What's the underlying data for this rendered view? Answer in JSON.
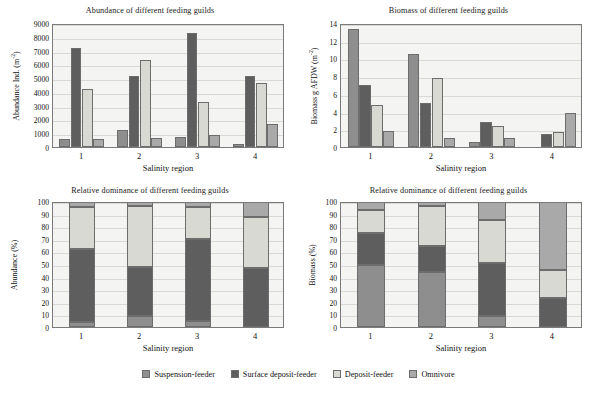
{
  "colors": {
    "suspension_feeder": "#8e8e8e",
    "surface_deposit_feeder": "#5e5e5e",
    "deposit_feeder": "#d9d9d4",
    "omnivore": "#a9a9a9",
    "plot_background": "#f4f4f2",
    "axis": "#7a7a7a",
    "gridline": "#d8d8d4"
  },
  "legend": {
    "items": [
      {
        "label": "Suspension-feeder",
        "color_key": "suspension_feeder"
      },
      {
        "label": "Surface deposit-feeder",
        "color_key": "surface_deposit_feeder"
      },
      {
        "label": "Deposit-feeder",
        "color_key": "deposit_feeder"
      },
      {
        "label": "Omnivore",
        "color_key": "omnivore"
      }
    ]
  },
  "chart_data": [
    {
      "id": "abundance",
      "type": "bar",
      "title": "Abundance of different feeding guilds",
      "xlabel": "Salinity region",
      "ylabel_main": "Abundance Ind. (m",
      "ylabel_sup": "-2",
      "ylabel_tail": ")",
      "categories": [
        "1",
        "2",
        "3",
        "4"
      ],
      "ylim": [
        0,
        9000
      ],
      "ytick_step": 1000,
      "yticks": [
        0,
        1000,
        2000,
        3000,
        4000,
        5000,
        6000,
        7000,
        8000,
        9000
      ],
      "grid": true,
      "legend_position": "bottom-shared",
      "series": [
        {
          "name": "Suspension-feeder",
          "color_key": "suspension_feeder",
          "values": [
            570,
            1200,
            720,
            250
          ]
        },
        {
          "name": "Surface deposit-feeder",
          "color_key": "surface_deposit_feeder",
          "values": [
            7200,
            5120,
            8280,
            5150
          ]
        },
        {
          "name": "Deposit-feeder",
          "color_key": "deposit_feeder",
          "values": [
            4200,
            6320,
            3250,
            4650
          ]
        },
        {
          "name": "Omnivore",
          "color_key": "omnivore",
          "values": [
            570,
            620,
            860,
            1670
          ]
        }
      ]
    },
    {
      "id": "biomass",
      "type": "bar",
      "title": "Biomass of different feeding guilds",
      "xlabel": "Salinity region",
      "ylabel_main": "Biomass g AFDW (m",
      "ylabel_sup": "-2",
      "ylabel_tail": ")",
      "categories": [
        "1",
        "2",
        "3",
        "4"
      ],
      "ylim": [
        0,
        14
      ],
      "ytick_step": 2,
      "yticks": [
        0,
        2,
        4,
        6,
        8,
        10,
        12,
        14
      ],
      "grid": true,
      "legend_position": "bottom-shared",
      "series": [
        {
          "name": "Suspension-feeder",
          "color_key": "suspension_feeder",
          "values": [
            13.3,
            10.5,
            0.6,
            0.0
          ]
        },
        {
          "name": "Surface deposit-feeder",
          "color_key": "surface_deposit_feeder",
          "values": [
            6.95,
            4.95,
            2.8,
            1.5
          ]
        },
        {
          "name": "Deposit-feeder",
          "color_key": "deposit_feeder",
          "values": [
            4.8,
            7.8,
            2.35,
            1.65
          ]
        },
        {
          "name": "Omnivore",
          "color_key": "omnivore",
          "values": [
            1.85,
            1.05,
            1.05,
            3.8
          ]
        }
      ]
    },
    {
      "id": "relative-abundance",
      "type": "bar",
      "stacked": true,
      "title": "Relative dominance of different feeding guilds",
      "xlabel": "Salinity region",
      "ylabel_main": "Abundance (%)",
      "ylabel_sup": "",
      "ylabel_tail": "",
      "categories": [
        "1",
        "2",
        "3",
        "4"
      ],
      "ylim": [
        0,
        100
      ],
      "ytick_step": 10,
      "yticks": [
        0,
        10,
        20,
        30,
        40,
        50,
        60,
        70,
        80,
        90,
        100
      ],
      "grid": true,
      "legend_position": "bottom-shared",
      "series": [
        {
          "name": "Suspension-feeder",
          "color_key": "suspension_feeder",
          "values": [
            4,
            9,
            5,
            0
          ]
        },
        {
          "name": "Surface deposit-feeder",
          "color_key": "surface_deposit_feeder",
          "values": [
            58,
            39,
            65,
            47
          ]
        },
        {
          "name": "Deposit-feeder",
          "color_key": "deposit_feeder",
          "values": [
            33,
            48,
            25,
            40
          ]
        },
        {
          "name": "Omnivore",
          "color_key": "omnivore",
          "values": [
            5,
            4,
            5,
            13
          ]
        }
      ]
    },
    {
      "id": "relative-biomass",
      "type": "bar",
      "stacked": true,
      "title": "Relative dominance of different feeding guilds",
      "xlabel": "Salinity region",
      "ylabel_main": "Biomass (%)",
      "ylabel_sup": "",
      "ylabel_tail": "",
      "categories": [
        "1",
        "2",
        "3",
        "4"
      ],
      "ylim": [
        0,
        100
      ],
      "ytick_step": 10,
      "yticks": [
        0,
        10,
        20,
        30,
        40,
        50,
        60,
        70,
        80,
        90,
        100
      ],
      "grid": true,
      "legend_position": "bottom-shared",
      "series": [
        {
          "name": "Suspension-feeder",
          "color_key": "suspension_feeder",
          "values": [
            49,
            44,
            9,
            0
          ]
        },
        {
          "name": "Surface deposit-feeder",
          "color_key": "surface_deposit_feeder",
          "values": [
            26,
            20,
            42,
            23
          ]
        },
        {
          "name": "Deposit-feeder",
          "color_key": "deposit_feeder",
          "values": [
            18,
            32,
            34,
            22
          ]
        },
        {
          "name": "Omnivore",
          "color_key": "omnivore",
          "values": [
            7,
            4,
            15,
            55
          ]
        }
      ]
    }
  ]
}
